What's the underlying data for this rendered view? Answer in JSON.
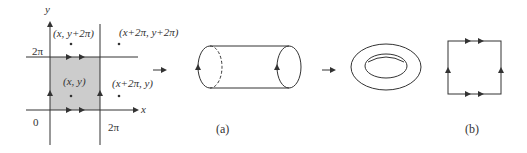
{
  "figure": {
    "panel_left": {
      "axis_x_label": "x",
      "axis_y_label": "y",
      "origin_label": "0",
      "tick_x_label": "2π",
      "tick_y_label": "2π",
      "points": [
        {
          "label": "(x, y)"
        },
        {
          "label": "(x, y+2π)"
        },
        {
          "label": "(x+2π, y)"
        },
        {
          "label": "(x+2π, y+2π)"
        }
      ],
      "shaded_color": "#cccccc"
    },
    "panel_a": {
      "caption": "(a)",
      "shape": "cylinder"
    },
    "panel_torus": {
      "shape": "torus"
    },
    "panel_b": {
      "caption": "(b)",
      "shape": "square with identified edges"
    }
  }
}
